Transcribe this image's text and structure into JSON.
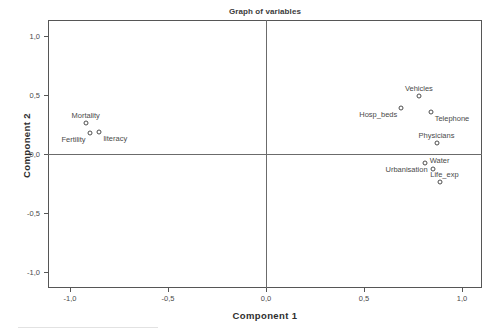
{
  "chart_data": {
    "type": "scatter",
    "title": "Graph of variables",
    "xlabel": "Component 1",
    "ylabel": "Component 2",
    "xlim": [
      -1.1,
      1.1
    ],
    "ylim": [
      -1.1,
      1.1
    ],
    "grid": false,
    "legend": null,
    "decimal_separator": ",",
    "xticks": [
      "-1,0",
      "-0,5",
      "0,0",
      "0,5",
      "1,0"
    ],
    "xtick_values": [
      -1.0,
      -0.5,
      0.0,
      0.5,
      1.0
    ],
    "yticks": [
      "1,0",
      "0,5",
      "0,0",
      "-0,5",
      "-1,0"
    ],
    "ytick_values": [
      1.0,
      0.5,
      0.0,
      -0.5,
      -1.0
    ],
    "zero_lines": {
      "x": 0.0,
      "y": 0.0
    },
    "points": [
      {
        "label": "Mortality",
        "x": -0.92,
        "y": 0.26,
        "label_pos": "above"
      },
      {
        "label": "Fertility",
        "x": -0.9,
        "y": 0.18,
        "label_pos": "left-below"
      },
      {
        "label": "literacy",
        "x": -0.85,
        "y": 0.19,
        "label_pos": "right-below"
      },
      {
        "label": "Vehicles",
        "x": 0.78,
        "y": 0.49,
        "label_pos": "above"
      },
      {
        "label": "Hosp_beds",
        "x": 0.69,
        "y": 0.39,
        "label_pos": "left-below"
      },
      {
        "label": "Telephone",
        "x": 0.84,
        "y": 0.36,
        "label_pos": "right-below"
      },
      {
        "label": "Physicians",
        "x": 0.87,
        "y": 0.09,
        "label_pos": "above"
      },
      {
        "label": "Water",
        "x": 0.81,
        "y": -0.08,
        "label_pos": "right"
      },
      {
        "label": "Urbanisation",
        "x": 0.85,
        "y": -0.13,
        "label_pos": "left"
      },
      {
        "label": "Life_exp",
        "x": 0.89,
        "y": -0.24,
        "label_pos": "above-right"
      }
    ]
  },
  "colors": {
    "frame": "#565656",
    "zero_line": "#6b6b6b",
    "marker_stroke": "#4d4d4d",
    "text": "#4a4a4a",
    "title": "#3b3b3b",
    "axis_title": "#2e2e2e",
    "background": "#ffffff"
  }
}
